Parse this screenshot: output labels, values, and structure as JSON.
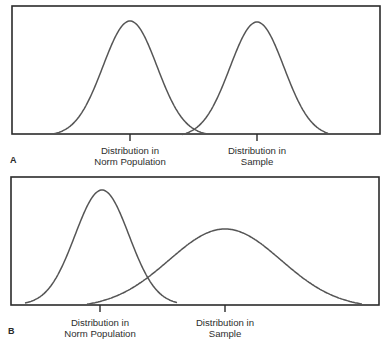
{
  "figure": {
    "panels": [
      {
        "id": "A",
        "letter": "A",
        "box": {
          "x1": 12,
          "y1": 6,
          "x2": 380,
          "y2": 134
        },
        "curves": [
          {
            "name": "Distribution in Norm Population",
            "center_x": 130,
            "peak_y": 21,
            "baseline_y": 136,
            "sigma": 27,
            "x_start": 53,
            "x_end": 206
          },
          {
            "name": "Distribution in Sample",
            "center_x": 257,
            "peak_y": 22,
            "baseline_y": 137,
            "sigma": 27,
            "x_start": 182,
            "x_end": 331
          }
        ],
        "ticks": [
          {
            "x": 130,
            "label_line1": "Distribution in",
            "label_line2": "Norm Population"
          },
          {
            "x": 257,
            "label_line1": "Distribution in",
            "label_line2": "Sample"
          }
        ]
      },
      {
        "id": "B",
        "letter": "B",
        "box": {
          "x1": 11,
          "y1": 177,
          "x2": 379,
          "y2": 305
        },
        "curves": [
          {
            "name": "Distribution in Norm Population",
            "center_x": 102,
            "peak_y": 190,
            "baseline_y": 305,
            "sigma": 27,
            "x_start": 25,
            "x_end": 177
          },
          {
            "name": "Distribution in Sample",
            "center_x": 225,
            "peak_y": 229,
            "baseline_y": 308,
            "sigma": 56,
            "x_start": 87,
            "x_end": 362
          }
        ],
        "ticks": [
          {
            "x": 100,
            "label_line1": "Distribution in",
            "label_line2": "Norm Population"
          },
          {
            "x": 225,
            "label_line1": "Distribution in",
            "label_line2": "Sample"
          }
        ]
      }
    ],
    "colors": {
      "box": "#2b2b2b",
      "curve": "#555555",
      "text": "#2e2e2e"
    }
  }
}
